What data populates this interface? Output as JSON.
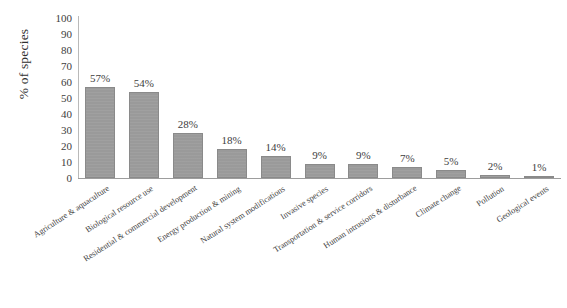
{
  "chart_data": {
    "type": "bar",
    "title": "",
    "xlabel": "",
    "ylabel": "% of species",
    "ylim": [
      0,
      100
    ],
    "ytick_step": 10,
    "yticks": [
      "0",
      "10",
      "20",
      "30",
      "40",
      "50",
      "60",
      "70",
      "80",
      "90",
      "100"
    ],
    "grid": false,
    "legend": false,
    "bar_color": "#9a9a9a",
    "categories": [
      "Agriculture & aquaculture",
      "Biological resource use",
      "Residential & commercial development",
      "Energy production & mining",
      "Natural system modifications",
      "Invasive species",
      "Transportation & service corridors",
      "Human intrusions & disturbance",
      "Climate change",
      "Pollution",
      "Geological events"
    ],
    "values": [
      57,
      54,
      28,
      18,
      14,
      9,
      9,
      7,
      5,
      2,
      1
    ],
    "data_labels": [
      "57%",
      "54%",
      "28%",
      "18%",
      "14%",
      "9%",
      "9%",
      "7%",
      "5%",
      "2%",
      "1%"
    ]
  }
}
